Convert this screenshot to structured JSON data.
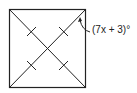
{
  "diagram": {
    "shape": "square",
    "angle_label": "(7x + 3)°",
    "stroke_color": "#222222",
    "diagonals": 2,
    "congruence_ticks": 4
  }
}
